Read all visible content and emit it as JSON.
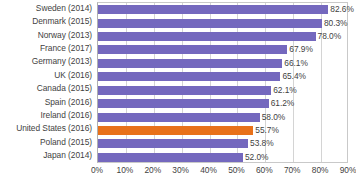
{
  "chart_data": {
    "type": "bar",
    "orientation": "horizontal",
    "title": "",
    "subtitle": "",
    "xlabel": "",
    "ylabel": "",
    "xlim": [
      0,
      90
    ],
    "grid": true,
    "legend": false,
    "value_suffix": "%",
    "xticks": [
      "0%",
      "10%",
      "20%",
      "30%",
      "40%",
      "50%",
      "60%",
      "70%",
      "80%",
      "90%"
    ],
    "xtick_values": [
      0,
      10,
      20,
      30,
      40,
      50,
      60,
      70,
      80,
      90
    ],
    "categories": [
      "Sweden (2014)",
      "Denmark (2015)",
      "Norway (2013)",
      "France (2017)",
      "Germany (2013)",
      "UK (2016)",
      "Canada (2015)",
      "Spain (2016)",
      "Ireland (2016)",
      "United States (2016)",
      "Poland (2015)",
      "Japan (2014)"
    ],
    "values": [
      82.6,
      80.3,
      78.0,
      67.9,
      66.1,
      65.4,
      62.1,
      61.2,
      58.0,
      55.7,
      53.8,
      52.0
    ],
    "value_labels": [
      "82.6%",
      "80.3%",
      "78.0%",
      "67.9%",
      "66.1%",
      "65.4%",
      "62.1%",
      "61.2%",
      "58.0%",
      "55.7%",
      "53.8%",
      "52.0%"
    ],
    "highlight_index": 9,
    "colors": {
      "bar": "#7468be",
      "highlight_bar": "#e8711a",
      "gridline": "#d4d4d4",
      "plot_border": "#c9c9c9",
      "text": "#3f3f3f",
      "background": "#ffffff"
    }
  }
}
